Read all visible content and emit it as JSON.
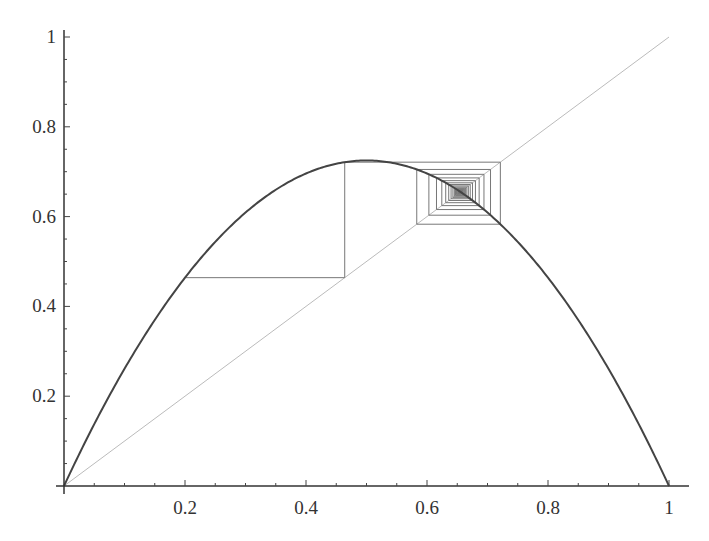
{
  "chart_data": {
    "type": "line",
    "title": "",
    "xlabel": "",
    "ylabel": "",
    "xlim": [
      0,
      1
    ],
    "ylim": [
      0,
      1
    ],
    "grid": false,
    "legend": "none",
    "x_ticks": [
      0.2,
      0.4,
      0.6,
      0.8,
      1
    ],
    "x_tick_labels": [
      "0.2",
      "0.4",
      "0.6",
      "0.8",
      "1"
    ],
    "y_ticks": [
      0.2,
      0.4,
      0.6,
      0.8,
      1
    ],
    "y_tick_labels": [
      "0.2",
      "0.4",
      "0.6",
      "0.8",
      "1"
    ],
    "series": [
      {
        "name": "logistic map f(x) = r x (1 - x)",
        "kind": "function",
        "r": 2.9,
        "color": "#444444",
        "width": 2
      },
      {
        "name": "identity y = x",
        "kind": "diagonal",
        "color": "#bbbbbb",
        "width": 1
      },
      {
        "name": "cobweb iteration",
        "kind": "cobweb",
        "x0": 0.2,
        "iterations": 120,
        "color": "#777777",
        "width": 1
      }
    ],
    "annotations": {
      "fixed_point": 0.655,
      "peak": {
        "x": 0.5,
        "y": 0.725
      }
    }
  }
}
